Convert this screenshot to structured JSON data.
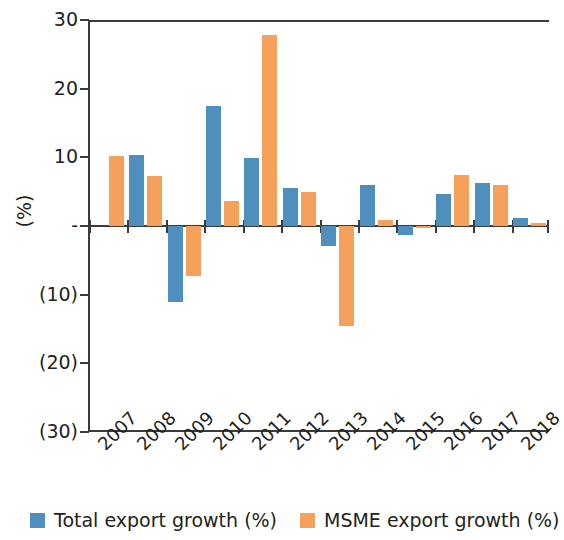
{
  "chart_data": {
    "type": "bar",
    "title": "",
    "xlabel": "",
    "ylabel": "(%)",
    "categories": [
      "2007",
      "2008",
      "2009",
      "2010",
      "2011",
      "2012",
      "2013",
      "2014",
      "2015",
      "2016",
      "2017",
      "2018"
    ],
    "series": [
      {
        "name": "Total export growth (%)",
        "color": "#4f8fbe",
        "values": [
          null,
          10.4,
          -11.1,
          17.5,
          9.9,
          5.6,
          -2.9,
          6.0,
          -1.3,
          4.6,
          6.3,
          1.2
        ]
      },
      {
        "name": "MSME export growth (%)",
        "color": "#f5a15c",
        "values": [
          10.2,
          7.3,
          -7.3,
          3.7,
          27.8,
          4.9,
          -14.6,
          0.9,
          -0.3,
          7.5,
          5.9,
          0.4
        ]
      }
    ],
    "ylim": [
      -30,
      30
    ],
    "yticks": [
      30,
      20,
      10,
      0,
      -10,
      -20,
      -30
    ],
    "ytick_labels": [
      "30",
      "20",
      "10",
      "-",
      "(10)",
      "(20)",
      "(30)"
    ],
    "grid": false,
    "legend_position": "bottom"
  },
  "legend": {
    "entries": [
      {
        "label": "Total export growth (%)",
        "color": "#4f8fbe"
      },
      {
        "label": "MSME export growth (%)",
        "color": "#f5a15c"
      }
    ]
  }
}
